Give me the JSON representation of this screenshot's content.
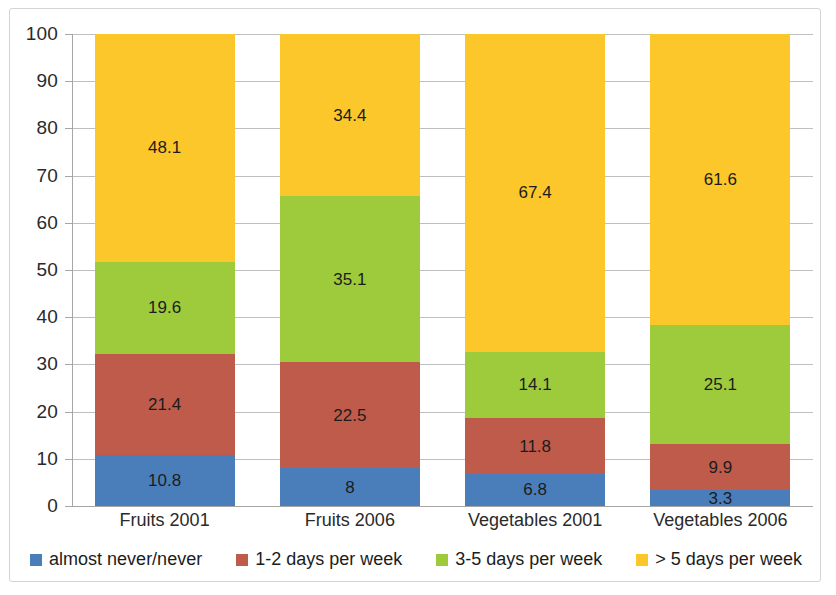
{
  "chart_data": {
    "type": "bar",
    "subtype": "stacked-bar-100",
    "title": "",
    "subtitle": "",
    "xlabel": "",
    "ylabel": "",
    "ylim": [
      0,
      100
    ],
    "yticks": [
      0,
      10,
      20,
      30,
      40,
      50,
      60,
      70,
      80,
      90,
      100
    ],
    "ytick_labels": [
      "0",
      "10",
      "20",
      "30",
      "40",
      "50",
      "60",
      "70",
      "80",
      "90",
      "100"
    ],
    "grid": true,
    "legend_position": "bottom",
    "categories": [
      "Fruits 2001",
      "Fruits 2006",
      "Vegetables 2001",
      "Vegetables 2006"
    ],
    "series": [
      {
        "name": "almost never/never",
        "color": "#4A7EBB",
        "values": [
          10.8,
          8,
          6.8,
          3.3
        ],
        "labels": [
          "10.8",
          "8",
          "6.8",
          "3.3"
        ]
      },
      {
        "name": "1-2 days per week",
        "color": "#BE5B4A",
        "values": [
          21.4,
          22.5,
          11.8,
          9.9
        ],
        "labels": [
          "21.4",
          "22.5",
          "11.8",
          "9.9"
        ]
      },
      {
        "name": "3-5 days per week",
        "color": "#9ECB3C",
        "values": [
          19.6,
          35.1,
          14.1,
          25.1
        ],
        "labels": [
          "19.6",
          "35.1",
          "14.1",
          "25.1"
        ]
      },
      {
        "name": "> 5 days per week",
        "color": "#FBC72A",
        "values": [
          48.1,
          34.4,
          67.4,
          61.6
        ],
        "labels": [
          "48.1",
          "34.4",
          "67.4",
          "61.6"
        ]
      }
    ]
  },
  "legend": {
    "items": [
      {
        "label": "almost never/never",
        "color": "#4A7EBB"
      },
      {
        "label": "1-2 days per week",
        "color": "#BE5B4A"
      },
      {
        "label": "3-5 days per week",
        "color": "#9ECB3C"
      },
      {
        "label": "> 5 days per week",
        "color": "#FBC72A"
      }
    ]
  },
  "axis": {
    "y_tick_labels": [
      "100",
      "90",
      "80",
      "70",
      "60",
      "50",
      "40",
      "30",
      "20",
      "10",
      "0"
    ],
    "x_tick_labels": [
      "Fruits 2001",
      "Fruits 2006",
      "Vegetables 2001",
      "Vegetables 2006"
    ]
  }
}
